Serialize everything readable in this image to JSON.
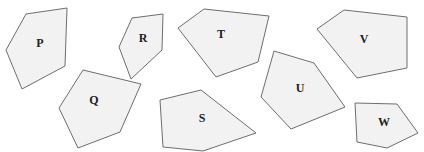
{
  "diagram": {
    "fill_color": "#f2f2f2",
    "stroke_color": "#6e6e6e",
    "label_color": "#222222",
    "shapes": [
      {
        "label": "P",
        "points": "26,14 67,8 65,66 22,89 6,50",
        "label_x": 40,
        "label_y": 44
      },
      {
        "label": "R",
        "points": "132,18 163,14 162,50 131,79 119,47",
        "label_x": 143,
        "label_y": 39
      },
      {
        "label": "T",
        "points": "204,9 269,16 258,62 216,77 178,28",
        "label_x": 221,
        "label_y": 35
      },
      {
        "label": "V",
        "points": "344,10 407,17 407,68 357,78 317,29",
        "label_x": 364,
        "label_y": 40
      },
      {
        "label": "Q",
        "points": "83,70 141,84 120,132 78,148 59,108",
        "label_x": 94,
        "label_y": 101
      },
      {
        "label": "S",
        "points": "160,100 201,90 256,133 203,151 163,147",
        "label_x": 202,
        "label_y": 119
      },
      {
        "label": "U",
        "points": "274,51 314,63 345,107 291,129 261,97",
        "label_x": 300,
        "label_y": 89
      },
      {
        "label": "W",
        "points": "355,103 397,104 418,133 387,148 357,142",
        "label_x": 384,
        "label_y": 123
      }
    ]
  }
}
